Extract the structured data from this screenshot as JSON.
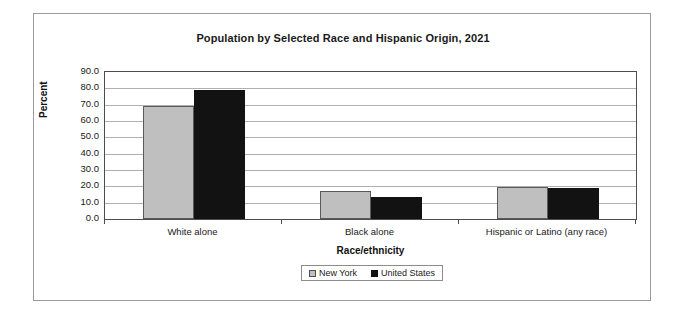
{
  "chart_data": {
    "type": "bar",
    "title": "Population by Selected Race and Hispanic Origin, 2021",
    "xlabel": "Race/ethnicity",
    "ylabel": "Percent",
    "ylim": [
      0.0,
      90.0
    ],
    "ytick_step": 10.0,
    "ytick_labels": [
      "90.0",
      "80.0",
      "70.0",
      "60.0",
      "50.0",
      "40.0",
      "30.0",
      "20.0",
      "10.0",
      "0.0"
    ],
    "grid": true,
    "legend_position": "bottom-center",
    "categories": [
      "White alone",
      "Black alone",
      "Hispanic or Latino (any race)"
    ],
    "series": [
      {
        "name": "New York",
        "color": "#bfbfbf",
        "values": [
          69.0,
          17.0,
          19.5
        ]
      },
      {
        "name": "United States",
        "color": "#121212",
        "values": [
          79.0,
          13.5,
          19.0
        ]
      }
    ]
  },
  "legend": {
    "items": [
      {
        "label": "New York"
      },
      {
        "label": "United States"
      }
    ]
  }
}
